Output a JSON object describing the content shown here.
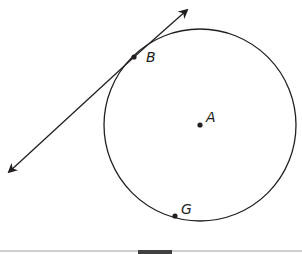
{
  "diagram": {
    "circle": {
      "center_label": "A",
      "cx": 200,
      "cy": 125,
      "r": 96
    },
    "points": [
      {
        "label": "A",
        "x": 200,
        "y": 125,
        "role": "center"
      },
      {
        "label": "B",
        "x": 134,
        "y": 57,
        "role": "point of tangency"
      },
      {
        "label": "G",
        "x": 175,
        "y": 216,
        "role": "point on circle"
      }
    ],
    "tangent_line": {
      "through": "B",
      "arrows": "both"
    }
  },
  "labels": {
    "a": "A",
    "b": "B",
    "g": "G"
  },
  "colors": {
    "stroke": "#231f20",
    "rule": "#a0a0a0",
    "rule_block": "#404040"
  }
}
